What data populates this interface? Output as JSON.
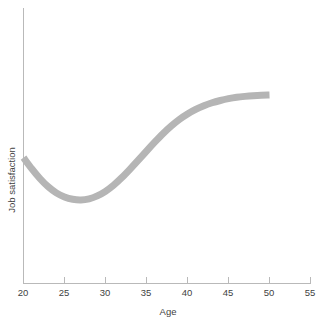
{
  "chart_data": {
    "type": "line",
    "title": "",
    "xlabel": "Age",
    "ylabel": "Job satisfaction",
    "xlim": [
      20,
      55
    ],
    "ylim": [
      0,
      1
    ],
    "grid": false,
    "legend": false,
    "x_ticks": [
      20,
      25,
      30,
      35,
      40,
      45,
      50,
      55
    ],
    "x_tick_labels": [
      "20",
      "25",
      "30",
      "35",
      "40",
      "45",
      "50",
      "55"
    ],
    "y_ticks": [],
    "y_tick_labels": [],
    "series": [
      {
        "name": "Job satisfaction",
        "color": "#b5b5b5",
        "line_width": 7,
        "x": [
          20,
          21,
          22,
          23,
          24,
          25,
          26,
          27,
          28,
          29,
          30,
          31,
          32,
          33,
          34,
          35,
          36,
          37,
          38,
          39,
          40,
          41,
          42,
          43,
          44,
          45,
          46,
          47,
          48,
          49,
          50
        ],
        "y": [
          0.675,
          0.627,
          0.584,
          0.548,
          0.521,
          0.503,
          0.493,
          0.49,
          0.495,
          0.508,
          0.528,
          0.555,
          0.588,
          0.625,
          0.664,
          0.704,
          0.743,
          0.78,
          0.813,
          0.842,
          0.866,
          0.886,
          0.902,
          0.915,
          0.925,
          0.933,
          0.939,
          0.943,
          0.946,
          0.948,
          0.949
        ]
      }
    ],
    "annotations": []
  },
  "axis": {
    "x_axis_name": "x-axis",
    "y_axis_name": "y-axis"
  },
  "colors": {
    "curve": "#b5b5b5",
    "axis": "#b9b9b9",
    "text": "#3f3f3f",
    "background": "#ffffff"
  }
}
